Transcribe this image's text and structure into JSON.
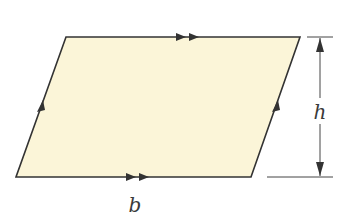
{
  "diagram": {
    "type": "parallelogram",
    "fill_color": "#fbf5d8",
    "stroke_color": "#333333",
    "vertices": {
      "top_left": [
        66,
        37
      ],
      "top_right": [
        300,
        37
      ],
      "bottom_right": [
        251,
        177
      ],
      "bottom_left": [
        16,
        177
      ]
    },
    "labels": {
      "base": "b",
      "height": "h"
    },
    "markings": {
      "horizontal_sides": "double-arrow parallel marks",
      "slanted_sides": "single-arrow parallel marks"
    }
  }
}
